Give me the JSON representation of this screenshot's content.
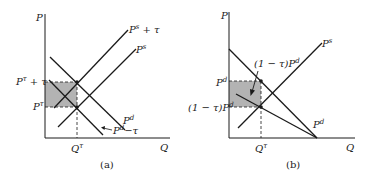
{
  "panels": [
    {
      "id": "a",
      "caption": "(a)",
      "axis_y_label": "P",
      "axis_x_label": "Q",
      "quantity_label": "Q",
      "quantity_sup": "τ",
      "price_high_label": "P",
      "price_high_sup": "τ",
      "price_high_suffix": " + τ",
      "price_low_label": "P",
      "price_low_sup": "τ",
      "curves": {
        "supply_plus_tax": {
          "base": "P",
          "sup": "s",
          "suffix": " + τ"
        },
        "supply": {
          "base": "P",
          "sup": "s"
        },
        "demand": {
          "base": "P",
          "sup": "d"
        },
        "demand_minus_tax": {
          "base": "P",
          "sup": "d",
          "suffix": "−τ"
        }
      }
    },
    {
      "id": "b",
      "caption": "(b)",
      "axis_y_label": "P",
      "axis_x_label": "Q",
      "quantity_label": "Q",
      "quantity_sup": "τ",
      "price_high_label": "P",
      "price_high_sup": "d",
      "price_low_prefix": "(1 − τ)P",
      "price_low_sup": "d",
      "annotation_prefix": "(1 − τ)P",
      "annotation_sup": "d",
      "curves": {
        "supply": {
          "base": "P",
          "sup": "s"
        },
        "demand": {
          "base": "P",
          "sup": "d"
        }
      }
    }
  ],
  "colors": {
    "line": "#1a1a1a",
    "shade": "#b3b3b3"
  }
}
